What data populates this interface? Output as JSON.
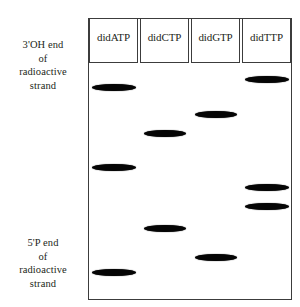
{
  "figure": {
    "annotations": {
      "top": {
        "lines": [
          "3'OH end",
          "of",
          "radioactive",
          "strand"
        ]
      },
      "bottom": {
        "lines": [
          "5'P end",
          "of",
          "radioactive",
          "strand"
        ]
      }
    },
    "gel": {
      "ink_color": "#050505",
      "outline_color": "#3c3c3c",
      "background_color": "#ffffff",
      "lanes": [
        {
          "id": "lane-didatp",
          "well_label": "didATP",
          "bands": [
            {
              "y": 87,
              "width": 44
            },
            {
              "y": 167,
              "width": 44
            },
            {
              "y": 272,
              "width": 44
            }
          ]
        },
        {
          "id": "lane-didctp",
          "well_label": "didCTP",
          "bands": [
            {
              "y": 133,
              "width": 42
            },
            {
              "y": 228,
              "width": 42
            }
          ]
        },
        {
          "id": "lane-didgtp",
          "well_label": "didGTP",
          "bands": [
            {
              "y": 114,
              "width": 42
            },
            {
              "y": 257,
              "width": 42
            }
          ]
        },
        {
          "id": "lane-didttp",
          "well_label": "didTTP",
          "bands": [
            {
              "y": 79,
              "width": 44
            },
            {
              "y": 187,
              "width": 44
            },
            {
              "y": 206,
              "width": 44
            }
          ]
        }
      ]
    }
  }
}
